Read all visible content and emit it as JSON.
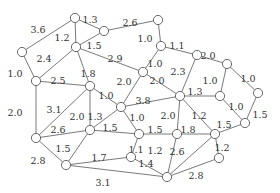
{
  "graph": {
    "type": "weighted-undirected",
    "nodes": [
      {
        "id": "A",
        "x": 75,
        "y": 18
      },
      {
        "id": "B",
        "x": 104,
        "y": 31
      },
      {
        "id": "C",
        "x": 22,
        "y": 52
      },
      {
        "id": "D",
        "x": 76,
        "y": 47
      },
      {
        "id": "E",
        "x": 36,
        "y": 81
      },
      {
        "id": "F",
        "x": 90,
        "y": 86
      },
      {
        "id": "G",
        "x": 158,
        "y": 20
      },
      {
        "id": "H",
        "x": 161,
        "y": 46
      },
      {
        "id": "I",
        "x": 143,
        "y": 72
      },
      {
        "id": "J",
        "x": 197,
        "y": 55
      },
      {
        "id": "K",
        "x": 227,
        "y": 64
      },
      {
        "id": "L",
        "x": 180,
        "y": 96
      },
      {
        "id": "M",
        "x": 220,
        "y": 96
      },
      {
        "id": "N",
        "x": 258,
        "y": 93
      },
      {
        "id": "O",
        "x": 245,
        "y": 123
      },
      {
        "id": "P",
        "x": 36,
        "y": 138
      },
      {
        "id": "Q",
        "x": 90,
        "y": 130
      },
      {
        "id": "R",
        "x": 121,
        "y": 107
      },
      {
        "id": "S",
        "x": 66,
        "y": 165
      },
      {
        "id": "T",
        "x": 139,
        "y": 134
      },
      {
        "id": "U",
        "x": 177,
        "y": 134
      },
      {
        "id": "V",
        "x": 131,
        "y": 157
      },
      {
        "id": "W",
        "x": 215,
        "y": 134
      },
      {
        "id": "X",
        "x": 219,
        "y": 158
      },
      {
        "id": "Y",
        "x": 167,
        "y": 177
      }
    ],
    "edges": [
      {
        "a": "A",
        "b": "B",
        "w": "1.3",
        "lx": 90,
        "ly": 20
      },
      {
        "a": "A",
        "b": "C",
        "w": "3.6",
        "lx": 38,
        "ly": 30
      },
      {
        "a": "A",
        "b": "D",
        "w": "1.2",
        "lx": 62,
        "ly": 38
      },
      {
        "a": "B",
        "b": "D",
        "w": "1.5",
        "lx": 94,
        "ly": 46
      },
      {
        "a": "B",
        "b": "G",
        "w": "2.6",
        "lx": 130,
        "ly": 23
      },
      {
        "a": "C",
        "b": "E",
        "w": "1.0",
        "lx": 15,
        "ly": 74
      },
      {
        "a": "D",
        "b": "E",
        "w": "2.4",
        "lx": 44,
        "ly": 59
      },
      {
        "a": "D",
        "b": "F",
        "w": "1.8",
        "lx": 88,
        "ly": 74
      },
      {
        "a": "D",
        "b": "I",
        "w": "2.9",
        "lx": 115,
        "ly": 59
      },
      {
        "a": "E",
        "b": "F",
        "w": "2.5",
        "lx": 58,
        "ly": 81
      },
      {
        "a": "E",
        "b": "P",
        "w": "2.0",
        "lx": 15,
        "ly": 113
      },
      {
        "a": "F",
        "b": "R",
        "w": "1.0",
        "lx": 106,
        "ly": 96
      },
      {
        "a": "F",
        "b": "Q",
        "w": "2.0",
        "lx": 77,
        "ly": 117
      },
      {
        "a": "G",
        "b": "H",
        "w": "1.0",
        "lx": 145,
        "ly": 39
      },
      {
        "a": "H",
        "b": "I",
        "w": "1.0",
        "lx": 155,
        "ly": 64
      },
      {
        "a": "H",
        "b": "J",
        "w": "1.1",
        "lx": 177,
        "ly": 46
      },
      {
        "a": "I",
        "b": "R",
        "w": "2.0",
        "lx": 124,
        "ly": 82
      },
      {
        "a": "I",
        "b": "L",
        "w": "2.0",
        "lx": 157,
        "ly": 81
      },
      {
        "a": "J",
        "b": "K",
        "w": "2.0",
        "lx": 208,
        "ly": 56
      },
      {
        "a": "J",
        "b": "L",
        "w": "2.3",
        "lx": 178,
        "ly": 72
      },
      {
        "a": "K",
        "b": "M",
        "w": "1.0",
        "lx": 210,
        "ly": 81
      },
      {
        "a": "K",
        "b": "N",
        "w": "1.0",
        "lx": 248,
        "ly": 79
      },
      {
        "a": "L",
        "b": "M",
        "w": "1.3",
        "lx": 195,
        "ly": 92
      },
      {
        "a": "M",
        "b": "O",
        "w": "1.0",
        "lx": 236,
        "ly": 107
      },
      {
        "a": "N",
        "b": "O",
        "w": "1.5",
        "lx": 260,
        "ly": 115
      },
      {
        "a": "R",
        "b": "L",
        "w": "3.8",
        "lx": 143,
        "ly": 101
      },
      {
        "a": "P",
        "b": "Q",
        "w": "2.6",
        "lx": 58,
        "ly": 130
      },
      {
        "a": "P",
        "b": "F",
        "w": "3.1",
        "lx": 54,
        "ly": 110
      },
      {
        "a": "Q",
        "b": "R",
        "w": "1.3",
        "lx": 95,
        "ly": 117
      },
      {
        "a": "P",
        "b": "S",
        "w": "2.8",
        "lx": 38,
        "ly": 161
      },
      {
        "a": "Q",
        "b": "S",
        "w": "1.5",
        "lx": 63,
        "ly": 149
      },
      {
        "a": "R",
        "b": "T",
        "w": "1.0",
        "lx": 137,
        "ly": 118
      },
      {
        "a": "Q",
        "b": "T",
        "w": "1.5",
        "lx": 110,
        "ly": 128
      },
      {
        "a": "L",
        "b": "U",
        "w": "2.0",
        "lx": 168,
        "ly": 116
      },
      {
        "a": "L",
        "b": "W",
        "w": "1.2",
        "lx": 199,
        "ly": 116
      },
      {
        "a": "T",
        "b": "U",
        "w": "1.5",
        "lx": 155,
        "ly": 130
      },
      {
        "a": "U",
        "b": "W",
        "w": "1.8",
        "lx": 188,
        "ly": 130
      },
      {
        "a": "W",
        "b": "O",
        "w": "1.5",
        "lx": 224,
        "ly": 125
      },
      {
        "a": "T",
        "b": "V",
        "w": "1.1",
        "lx": 136,
        "ly": 150
      },
      {
        "a": "U",
        "b": "Y",
        "w": "1.2",
        "lx": 155,
        "ly": 151
      },
      {
        "a": "W",
        "b": "Y",
        "w": "2.6",
        "lx": 177,
        "ly": 152
      },
      {
        "a": "W",
        "b": "X",
        "w": "1.2",
        "lx": 222,
        "ly": 148
      },
      {
        "a": "V",
        "b": "Y",
        "w": "1.4",
        "lx": 146,
        "ly": 164
      },
      {
        "a": "S",
        "b": "V",
        "w": "1.7",
        "lx": 99,
        "ly": 158
      },
      {
        "a": "S",
        "b": "Y",
        "w": "3.1",
        "lx": 103,
        "ly": 183
      },
      {
        "a": "X",
        "b": "Y",
        "w": "2.8",
        "lx": 196,
        "ly": 176
      }
    ]
  }
}
